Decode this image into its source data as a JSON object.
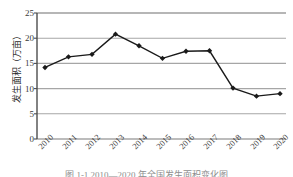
{
  "chart_data": {
    "type": "line",
    "title": "",
    "xlabel": "",
    "ylabel": "发生面积（万亩）",
    "categories": [
      "2010",
      "2011",
      "2012",
      "2013",
      "2014",
      "2015",
      "2016",
      "2017",
      "2018",
      "2019",
      "2020"
    ],
    "values": [
      14.2,
      16.3,
      16.8,
      20.8,
      18.5,
      16.0,
      17.4,
      17.5,
      10.1,
      8.5,
      9.0
    ],
    "series": [
      {
        "name": "发生面积",
        "values": [
          14.2,
          16.3,
          16.8,
          20.8,
          18.5,
          16.0,
          17.4,
          17.5,
          10.1,
          8.5,
          9.0
        ]
      }
    ],
    "ylim": [
      0,
      25
    ],
    "yticks": [
      0,
      5,
      10,
      15,
      20,
      25
    ],
    "ytick_labels": [
      "0",
      "5",
      "10",
      "15",
      "20",
      "25"
    ],
    "grid": "horizontal",
    "legend": "none",
    "line_color": "#1a1a1a",
    "marker": "diamond",
    "marker_color": "#1a1a1a",
    "grid_color": "#a6a6a6",
    "axis_color": "#4d4d4d"
  },
  "caption": {
    "text": "图 1-1  2010—2020 年全国发生面积变化图"
  },
  "axis": {
    "y_title": "发生面积（万亩）"
  }
}
